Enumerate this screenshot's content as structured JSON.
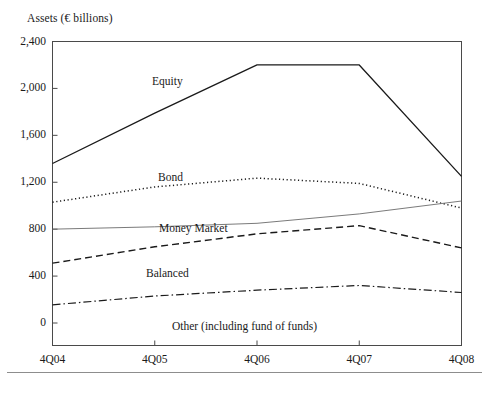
{
  "axis_title": "Assets (€ billions)",
  "yticks": [
    "0",
    "400",
    "800",
    "1,200",
    "1,600",
    "2,000",
    "2,400"
  ],
  "xticks": [
    "4Q04",
    "4Q05",
    "4Q06",
    "4Q07",
    "4Q08"
  ],
  "series_labels": {
    "equity": "Equity",
    "bond": "Bond",
    "money_market": "Money Market",
    "balanced": "Balanced",
    "other": "Other (including fund of funds)"
  },
  "colors": {
    "line": "#1a1a1a",
    "axis": "#4a4a4a",
    "money_market_line": "#6b6b6b",
    "footer_rule": "#8d8d8d",
    "background": "#ffffff"
  },
  "chart_data": {
    "type": "line",
    "title": "Assets (€ billions)",
    "xlabel": "",
    "ylabel": "Assets (€ billions)",
    "categories": [
      "4Q04",
      "4Q05",
      "4Q06",
      "4Q07",
      "4Q08"
    ],
    "ylim": [
      0,
      2400
    ],
    "ytick_values": [
      0,
      400,
      800,
      1200,
      1600,
      2000,
      2400
    ],
    "grid": false,
    "legend": "inline-labels",
    "series": [
      {
        "name": "Equity",
        "style": "solid",
        "values": [
          1360,
          1790,
          2200,
          2200,
          1250
        ]
      },
      {
        "name": "Bond",
        "style": "dotted",
        "values": [
          1030,
          1160,
          1235,
          1190,
          980
        ]
      },
      {
        "name": "Money Market",
        "style": "solid-thin",
        "values": [
          800,
          820,
          850,
          930,
          1040
        ]
      },
      {
        "name": "Balanced",
        "style": "dashed",
        "values": [
          510,
          650,
          760,
          830,
          640
        ]
      },
      {
        "name": "Other (including fund of funds)",
        "style": "dash-dot",
        "values": [
          155,
          230,
          280,
          320,
          260
        ]
      }
    ]
  }
}
